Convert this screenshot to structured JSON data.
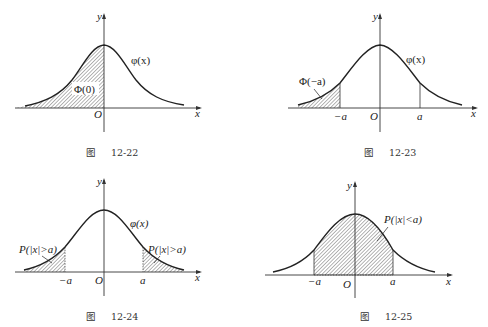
{
  "figures": [
    {
      "id": "12-22",
      "caption_prefix": "图",
      "caption_number": "12-22",
      "axis_x_label": "x",
      "axis_y_label": "y",
      "origin_label": "O",
      "curve_label": "φ(x)",
      "shaded_label": "Φ(0)",
      "shaded_region": "x < 0"
    },
    {
      "id": "12-23",
      "caption_prefix": "图",
      "caption_number": "12-23",
      "axis_x_label": "x",
      "axis_y_label": "y",
      "origin_label": "O",
      "curve_label": "φ(x)",
      "shaded_label": "Φ(−a)",
      "tick_neg": "−a",
      "tick_pos": "a",
      "shaded_region": "x < −a"
    },
    {
      "id": "12-24",
      "caption_prefix": "图",
      "caption_number": "12-24",
      "axis_x_label": "x",
      "axis_y_label": "y",
      "origin_label": "O",
      "curve_label": "φ(x)",
      "shaded_label_left": "P(|x|>a)",
      "shaded_label_right": "P(|x|>a)",
      "tick_neg": "−a",
      "tick_pos": "a",
      "shaded_region": "|x| > a"
    },
    {
      "id": "12-25",
      "caption_prefix": "图",
      "caption_number": "12-25",
      "axis_x_label": "x",
      "axis_y_label": "y",
      "origin_label": "O",
      "shaded_label": "P(|x|<a)",
      "tick_neg": "−a",
      "tick_pos": "a",
      "shaded_region": "|x| < a"
    }
  ]
}
